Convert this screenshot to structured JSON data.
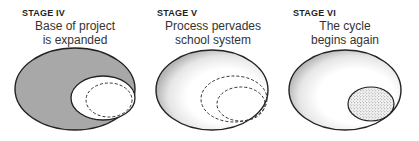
{
  "stages": [
    {
      "label": "STAGE IV",
      "caption_line1": "Base of project",
      "caption_line2": "is expanded",
      "outer_fill": "#a8a8a8",
      "inner_fill": "#ffffff"
    },
    {
      "label": "STAGE V",
      "caption_line1": "Process pervades",
      "caption_line2": "school system",
      "outer_fill": "gradient-gray-to-white"
    },
    {
      "label": "STAGE VI",
      "caption_line1": "The cycle",
      "caption_line2": "begins again",
      "outer_fill": "gradient-gray-to-white",
      "inner_fill": "stippled"
    }
  ],
  "colors": {
    "stroke": "#222222",
    "solid_gray": "#a8a8a8",
    "text": "#333333"
  }
}
